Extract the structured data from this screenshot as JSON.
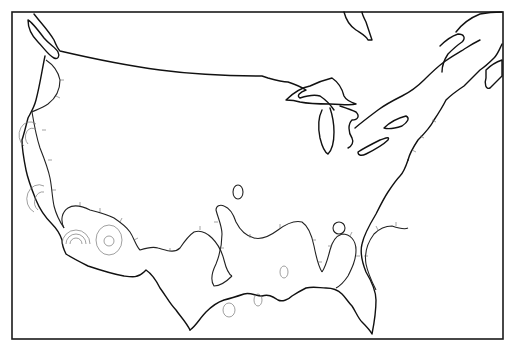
{
  "map": {
    "subject": "Contiguous United States outline with contour/depression lines",
    "style": "black-and-white line map",
    "colors": {
      "background": "#ffffff",
      "outline": "#111111",
      "contour": "#222222",
      "minor_contour": "#777777"
    },
    "features": [
      {
        "name": "Pacific coast contour band",
        "type": "hachured-contour"
      },
      {
        "name": "Southern border contour band",
        "type": "hachured-contour"
      },
      {
        "name": "Gulf coast contour lobes",
        "type": "hachured-contour"
      },
      {
        "name": "Atlantic coast contour",
        "type": "hachured-contour"
      },
      {
        "name": "Great Lakes",
        "type": "water-outline"
      },
      {
        "name": "Hudson Bay tip",
        "type": "water-outline"
      },
      {
        "name": "Isolated closed contours",
        "type": "closed-contour",
        "count": 6
      },
      {
        "name": "Concentric contour clusters (California)",
        "type": "concentric-contours",
        "count": 4
      }
    ]
  }
}
